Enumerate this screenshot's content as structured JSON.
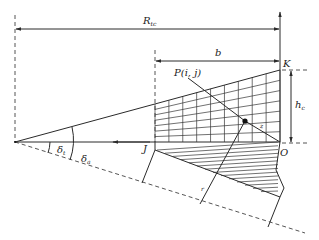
{
  "labels": {
    "R_main": "R",
    "R_sub": "tc",
    "b": "b",
    "K": "K",
    "P": "P(i, j)",
    "h_main": "h",
    "h_sub": "c",
    "z": "z",
    "J": "J",
    "O": "O",
    "delta_t_main": "δ",
    "delta_t_sub": "t",
    "delta_a_main": "δ",
    "delta_a_sub": "a",
    "r": "r"
  },
  "grid": {
    "columns": 9,
    "rows": 7
  },
  "colors": {
    "line": "#2a2a2a",
    "background": "#ffffff"
  }
}
